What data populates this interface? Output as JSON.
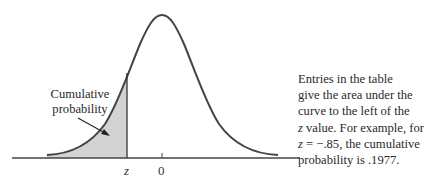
{
  "figure": {
    "type": "normal-distribution-diagram",
    "shaded_region": "left tail up to z",
    "fill_color": "#d3d3d3",
    "curve_color": "#444444",
    "axis": {
      "labels": [
        {
          "text": "z",
          "italic": true
        },
        {
          "text": "0",
          "italic": false
        }
      ]
    },
    "annotation": {
      "line1": "Cumulative",
      "line2": "probability"
    }
  },
  "caption": {
    "lines": [
      {
        "parts": [
          {
            "text": "Entries in the table",
            "italic": false
          }
        ]
      },
      {
        "parts": [
          {
            "text": "give the area under the",
            "italic": false
          }
        ]
      },
      {
        "parts": [
          {
            "text": "curve to the left of the",
            "italic": false
          }
        ]
      },
      {
        "parts": [
          {
            "text": "z",
            "italic": true
          },
          {
            "text": " value. For example, for",
            "italic": false
          }
        ]
      },
      {
        "parts": [
          {
            "text": "z",
            "italic": true
          },
          {
            "text": " = −.85, the cumulative",
            "italic": false
          }
        ]
      },
      {
        "parts": [
          {
            "text": "probability is .1977.",
            "italic": false
          }
        ]
      }
    ],
    "example": {
      "z": "-.85",
      "probability": ".1977"
    }
  }
}
